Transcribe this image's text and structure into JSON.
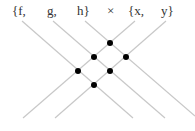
{
  "labels": {
    "f": "{f,",
    "g": "g,",
    "h": "h}",
    "times": "×",
    "x": "{x,",
    "y": "y}"
  },
  "diagram": {
    "set_a": [
      "f",
      "g",
      "h"
    ],
    "set_b": [
      "x",
      "y"
    ],
    "intersection_count": 6,
    "line_color": "#c8c8c8",
    "dot_color": "#000000"
  }
}
